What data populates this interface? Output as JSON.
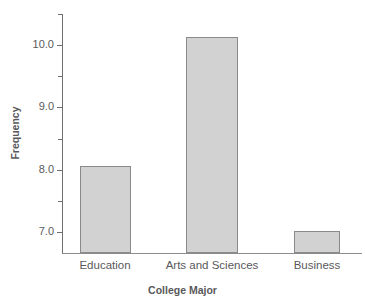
{
  "chart_data": {
    "type": "bar",
    "title": "",
    "xlabel": "College Major",
    "ylabel": "Frequency",
    "categories": [
      "Education",
      "Arts and Sciences",
      "Business"
    ],
    "values": [
      8.0,
      10.0,
      7.0
    ],
    "ylim": [
      6.66,
      10.35
    ],
    "ytick_labels": [
      "7.0",
      "8.0",
      "9.0",
      "10.0"
    ],
    "ytick_values": [
      7.0,
      8.0,
      9.0,
      10.0
    ],
    "yminor_values": [
      6.75,
      7.5,
      8.5,
      9.5,
      10.25
    ],
    "grid": false,
    "legend": null,
    "bar_fill_color": "#d2d2d2",
    "bar_border_color": "#8a8a8c",
    "axis_color": "#6f6f70",
    "text_color": "#59595b"
  },
  "ticks": {
    "y0": "7.0",
    "y1": "8.0",
    "y2": "9.0",
    "y3": "10.0"
  },
  "axes": {
    "x_title": "College Major",
    "y_title": "Frequency"
  },
  "categories": {
    "c0": "Education",
    "c1": "Arts and Sciences",
    "c2": "Business"
  },
  "title_remnant": ""
}
